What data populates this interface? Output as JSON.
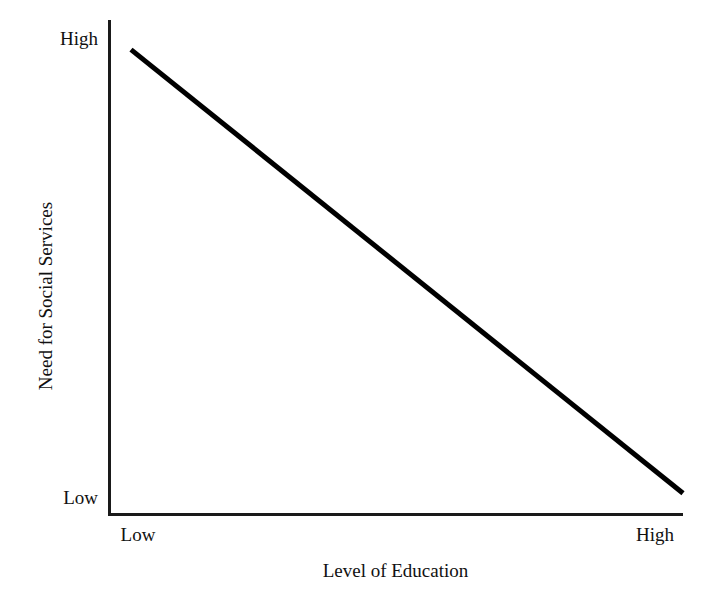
{
  "chart_data": {
    "type": "line",
    "title": "",
    "subtitle": "",
    "xlabel": "Level of Education",
    "ylabel": "Need for Social Services",
    "x_tick_labels": [
      "Low",
      "High"
    ],
    "y_tick_labels": [
      "Low",
      "High"
    ],
    "xlim": [
      0,
      1
    ],
    "ylim": [
      0,
      1
    ],
    "grid": false,
    "legend": null,
    "annotations": [],
    "series": [
      {
        "name": "Need for Social Services vs Level of Education",
        "x": [
          0.04,
          1.0
        ],
        "y": [
          0.94,
          0.04
        ],
        "points": [
          {
            "x_label": "Low",
            "y_label": "High"
          },
          {
            "x_label": "High",
            "y_label": "Low"
          }
        ],
        "relationship": "negative",
        "color": "#000000",
        "line_width": 5
      }
    ]
  },
  "figure": {
    "title_cropped": "",
    "background_color": "#ffffff",
    "axis_color": "#1a1a1a",
    "text_color": "#111111"
  },
  "axes": {
    "y_axis": {
      "title": "Need for Social Services",
      "high_label": "High",
      "low_label": "Low"
    },
    "x_axis": {
      "title": "Level of Education",
      "low_label": "Low",
      "high_label": "High"
    }
  }
}
